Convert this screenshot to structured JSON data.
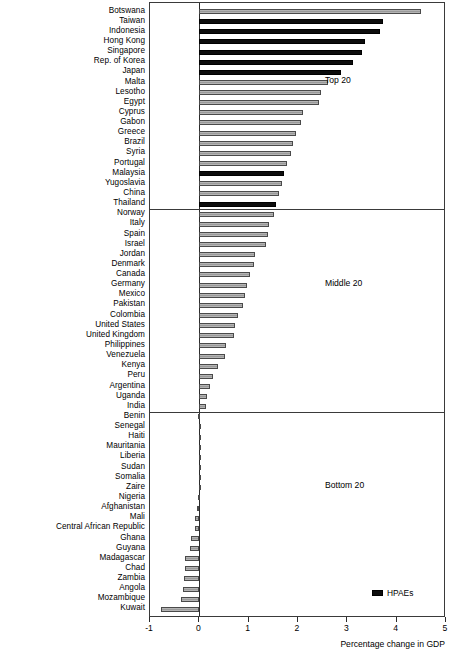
{
  "chart_data": {
    "type": "bar",
    "title": "",
    "xlabel": "Percentage change in GDP",
    "ylabel": "",
    "xlim": [
      -1,
      5
    ],
    "xticks": [
      -1,
      0,
      1,
      2,
      3,
      4,
      5
    ],
    "xtick_labels": [
      "-1",
      "0",
      "1",
      "2",
      "3",
      "4",
      "5"
    ],
    "orientation": "horizontal",
    "grid": false,
    "legend": {
      "position": "bottom-right",
      "entries": [
        {
          "label": "HPAEs",
          "color": "#0d0d0d"
        }
      ]
    },
    "series_colors": {
      "hpae": "#0d0d0d",
      "other": "#a8a8a8"
    },
    "sections": [
      {
        "label": "Top 20",
        "start": 0,
        "end": 20
      },
      {
        "label": "Middle 20",
        "start": 20,
        "end": 40
      },
      {
        "label": "Bottom 20",
        "start": 40,
        "end": 60
      }
    ],
    "categories": [
      "Botswana",
      "Taiwan",
      "Indonesia",
      "Hong Kong",
      "Singapore",
      "Rep. of Korea",
      "Japan",
      "Malta",
      "Lesotho",
      "Egypt",
      "Cyprus",
      "Gabon",
      "Greece",
      "Brazil",
      "Syria",
      "Portugal",
      "Malaysia",
      "Yugoslavia",
      "China",
      "Thailand",
      "Norway",
      "Italy",
      "Spain",
      "Israel",
      "Jordan",
      "Denmark",
      "Canada",
      "Germany",
      "Mexico",
      "Pakistan",
      "Colombia",
      "United States",
      "United Kingdom",
      "Philippines",
      "Venezuela",
      "Kenya",
      "Peru",
      "Argentina",
      "Uganda",
      "India",
      "Benin",
      "Senegal",
      "Haiti",
      "Mauritania",
      "Liberia",
      "Sudan",
      "Somalia",
      "Zaire",
      "Nigeria",
      "Afghanistan",
      "Mali",
      "Central African Republic",
      "Ghana",
      "Guyana",
      "Madagascar",
      "Chad",
      "Zambia",
      "Angola",
      "Mozambique",
      "Kuwait"
    ],
    "values": [
      4.49,
      3.72,
      3.66,
      3.35,
      3.3,
      3.12,
      2.87,
      2.6,
      2.46,
      2.42,
      2.1,
      2.06,
      1.95,
      1.9,
      1.85,
      1.78,
      1.72,
      1.68,
      1.62,
      1.55,
      1.52,
      1.42,
      1.4,
      1.36,
      1.13,
      1.1,
      1.03,
      0.97,
      0.92,
      0.88,
      0.78,
      0.72,
      0.71,
      0.55,
      0.52,
      0.38,
      0.27,
      0.22,
      0.15,
      0.13,
      -0.02,
      -0.01,
      -0.01,
      -0.01,
      -0.01,
      -0.01,
      -0.01,
      -0.01,
      -0.02,
      -0.05,
      -0.08,
      -0.09,
      -0.17,
      -0.19,
      -0.3,
      -0.3,
      -0.32,
      -0.33,
      -0.38,
      -0.77
    ],
    "hpae_flags": [
      false,
      true,
      true,
      true,
      true,
      true,
      true,
      false,
      false,
      false,
      false,
      false,
      false,
      false,
      false,
      false,
      true,
      false,
      false,
      true,
      false,
      false,
      false,
      false,
      false,
      false,
      false,
      false,
      false,
      false,
      false,
      false,
      false,
      false,
      false,
      false,
      false,
      false,
      false,
      false,
      false,
      false,
      false,
      false,
      false,
      false,
      false,
      false,
      false,
      false,
      false,
      false,
      false,
      false,
      false,
      false,
      false,
      false,
      false,
      false
    ]
  }
}
